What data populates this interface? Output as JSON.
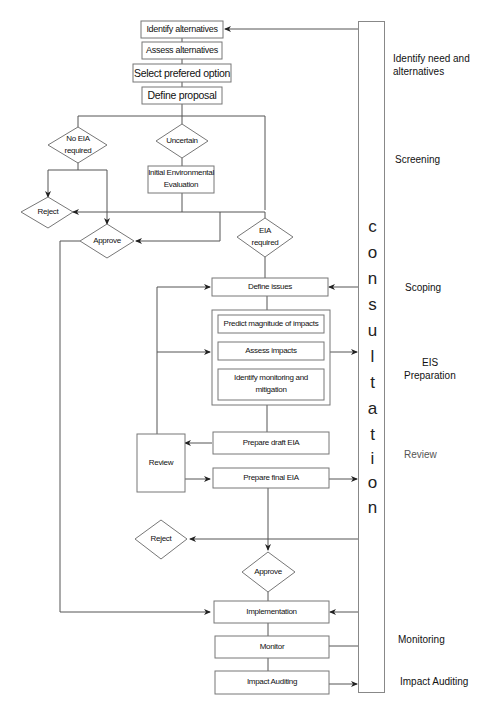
{
  "diagram": {
    "type": "flowchart"
  },
  "boxes": {
    "identify_alternatives": "Identify alternatives",
    "assess_alternatives": "Assess alternatives",
    "select_option": "Select prefered option",
    "define_proposal": "Define proposal",
    "iee_line1": "Initial Environmental",
    "iee_line2": "Evaluation",
    "define_issues": "Define issues",
    "predict_magnitude": "Predict magnitude of impacts",
    "assess_impacts": "Assess impacts",
    "identify_monitoring_line1": "Identify monitoring and",
    "identify_monitoring_line2": "mitigation",
    "prepare_draft": "Prepare draft EIA",
    "review": "Review",
    "prepare_final": "Prepare final EIA",
    "implementation": "Implementation",
    "monitor": "Monitor",
    "impact_auditing": "Impact Auditing"
  },
  "decisions": {
    "no_eia_line1": "No EIA",
    "no_eia_line2": "required",
    "uncertain": "Uncertain",
    "reject_1": "Reject",
    "approve_1": "Approve",
    "eia_required_line1": "EIA",
    "eia_required_line2": "required",
    "reject_2": "Reject",
    "approve_2": "Approve"
  },
  "consultation": {
    "letters": [
      "c",
      "o",
      "n",
      "s",
      "u",
      "l",
      "t",
      "a",
      "t",
      "i",
      "o",
      "n"
    ]
  },
  "stages": {
    "identify_need_line1": "Identify need and",
    "identify_need_line2": "alternatives",
    "screening": "Screening",
    "scoping": "Scoping",
    "eis_line1": "EIS",
    "eis_line2": "Preparation",
    "review": "Review",
    "monitoring": "Monitoring",
    "impact_auditing": "Impact Auditing"
  }
}
